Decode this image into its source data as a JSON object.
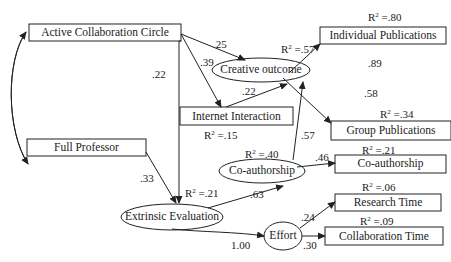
{
  "diagram": {
    "type": "path-model",
    "nodes": {
      "active_collaboration_circle": {
        "label": "Active Collaboration Circle",
        "shape": "rect"
      },
      "full_professor": {
        "label": "Full Professor",
        "shape": "rect"
      },
      "internet_interaction": {
        "label": "Internet Interaction",
        "shape": "rect",
        "r2": "=.15"
      },
      "creative_outcome": {
        "label": "Creative outcome",
        "shape": "ellipse",
        "r2": "=.57"
      },
      "individual_publications": {
        "label": "Individual Publications",
        "shape": "rect",
        "r2": "=.80"
      },
      "group_publications": {
        "label": "Group Publications",
        "shape": "rect",
        "r2": "=.34"
      },
      "coauthorship_latent": {
        "label": "Co-authorship",
        "shape": "ellipse",
        "r2": "=.40"
      },
      "coauthorship_observed": {
        "label": "Co-authorship",
        "shape": "rect",
        "r2": "=.21"
      },
      "extrinsic_evaluation": {
        "label": "Extrinsic Evaluation",
        "shape": "ellipse",
        "r2": "=.21"
      },
      "effort": {
        "label": "Effort",
        "shape": "ellipse"
      },
      "research_time": {
        "label": "Research Time",
        "shape": "rect",
        "r2": "=.06"
      },
      "collaboration_time": {
        "label": "Collaboration Time",
        "shape": "rect",
        "r2": "=.09"
      }
    },
    "r2_prefix": "R",
    "r2_sup": "2",
    "edges": [
      {
        "from": "active_collaboration_circle",
        "to": "creative_outcome",
        "coef": ".25"
      },
      {
        "from": "active_collaboration_circle",
        "to": "internet_interaction",
        "coef": ".39"
      },
      {
        "from": "active_collaboration_circle",
        "to": "extrinsic_evaluation",
        "coef": ".22"
      },
      {
        "from": "internet_interaction",
        "to": "creative_outcome",
        "coef": ".22"
      },
      {
        "from": "creative_outcome",
        "to": "individual_publications",
        "coef": ".89"
      },
      {
        "from": "creative_outcome",
        "to": "group_publications",
        "coef": ".58"
      },
      {
        "from": "coauthorship_latent",
        "to": "creative_outcome",
        "coef": ".57"
      },
      {
        "from": "coauthorship_latent",
        "to": "coauthorship_observed",
        "coef": ".46"
      },
      {
        "from": "full_professor",
        "to": "extrinsic_evaluation",
        "coef": ".33"
      },
      {
        "from": "extrinsic_evaluation",
        "to": "coauthorship_latent",
        "coef": ".63"
      },
      {
        "from": "extrinsic_evaluation",
        "to": "effort",
        "coef": "1.00"
      },
      {
        "from": "effort",
        "to": "research_time",
        "coef": ".24"
      },
      {
        "from": "effort",
        "to": "collaboration_time",
        "coef": ".30"
      },
      {
        "from": "active_collaboration_circle",
        "to": "full_professor",
        "coef": "",
        "kind": "covariance"
      }
    ]
  }
}
